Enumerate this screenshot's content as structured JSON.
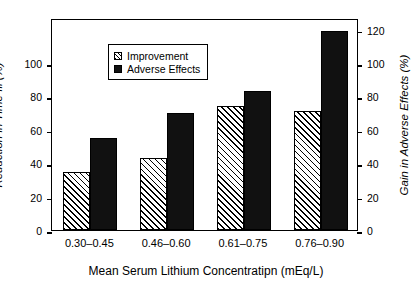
{
  "chart_data": {
    "type": "bar",
    "title": "",
    "subtitle": "",
    "xlabel": "Mean Serum Lithium Concentratipn (mEq/L)",
    "categories": [
      "0.30–0.45",
      "0.46–0.60",
      "0.61–0.75",
      "0.76–0.90"
    ],
    "series": [
      {
        "name": "Improvement",
        "axis": "left",
        "fill": "diagonal-hatch",
        "values": [
          34.5,
          43,
          74.5,
          71.5
        ]
      },
      {
        "name": "Adverse Effects",
        "axis": "right",
        "fill": "solid-black",
        "values": [
          55,
          70,
          83,
          119
        ]
      }
    ],
    "axes": {
      "left": {
        "label": "Reduction in Time Ill (%)",
        "ticks": [
          0,
          20,
          40,
          60,
          80,
          100
        ],
        "tick_labels": [
          "0",
          "20",
          "40",
          "60",
          "80",
          "100"
        ],
        "lim": [
          0,
          127
        ]
      },
      "right": {
        "label": "Gain in Adverse Effects (%)",
        "ticks": [
          0,
          20,
          40,
          60,
          80,
          100,
          120
        ],
        "tick_labels": [
          "0",
          "20",
          "40",
          "60",
          "80",
          "100",
          "120"
        ],
        "lim": [
          0,
          127
        ]
      }
    },
    "grid": false,
    "legend_position": "top-left",
    "legend_entries": [
      {
        "label": "Improvement",
        "swatch": "hatch-swatch-icon"
      },
      {
        "label": "Adverse Effects",
        "swatch": "solid-swatch-icon"
      }
    ],
    "colors": {
      "bar_adverse": "#111111",
      "bar_improvement_line": "#000000",
      "frame": "#000000",
      "background": "#ffffff"
    }
  }
}
